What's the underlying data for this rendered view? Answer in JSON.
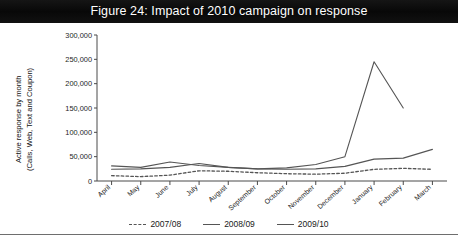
{
  "figure": {
    "title": "Figure 24: Impact of 2010 campaign on response"
  },
  "axes": {
    "y_title_line1": "Active response by month",
    "y_title_line2": "(Calls, Web, Text and Coupon)",
    "y_ticks": [
      "0",
      "50,000",
      "100,000",
      "150,000",
      "200,000",
      "250,000",
      "300,000"
    ]
  },
  "legend": {
    "items": [
      {
        "label": "2007/08",
        "style": "dashed",
        "color": "#555555"
      },
      {
        "label": "2008/09",
        "style": "solid",
        "color": "#555555"
      },
      {
        "label": "2009/10",
        "style": "solid",
        "color": "#555555"
      }
    ]
  },
  "chart_data": {
    "type": "line",
    "title": "Figure 24: Impact of 2010 campaign on response",
    "xlabel": "",
    "ylabel": "Active response by month (Calls, Web, Text and Coupon)",
    "ylim": [
      0,
      300000
    ],
    "ytick_step": 50000,
    "grid": false,
    "legend_position": "bottom",
    "categories": [
      "April",
      "May",
      "June",
      "July",
      "August",
      "September",
      "October",
      "November",
      "December",
      "January",
      "February",
      "March"
    ],
    "series": [
      {
        "name": "2007/08",
        "style": "dashed",
        "color": "#555555",
        "values": [
          11000,
          9000,
          12000,
          21000,
          20000,
          17000,
          15000,
          14000,
          16000,
          24000,
          26000,
          24000
        ]
      },
      {
        "name": "2008/09",
        "style": "solid",
        "color": "#555555",
        "values": [
          31000,
          28000,
          39000,
          32000,
          28000,
          25000,
          24000,
          25000,
          30000,
          45000,
          47000,
          65000
        ]
      },
      {
        "name": "2009/10",
        "style": "solid",
        "color": "#555555",
        "values": [
          24000,
          25000,
          28000,
          36000,
          28000,
          25000,
          27000,
          34000,
          50000,
          245000,
          150000,
          null
        ]
      }
    ]
  }
}
